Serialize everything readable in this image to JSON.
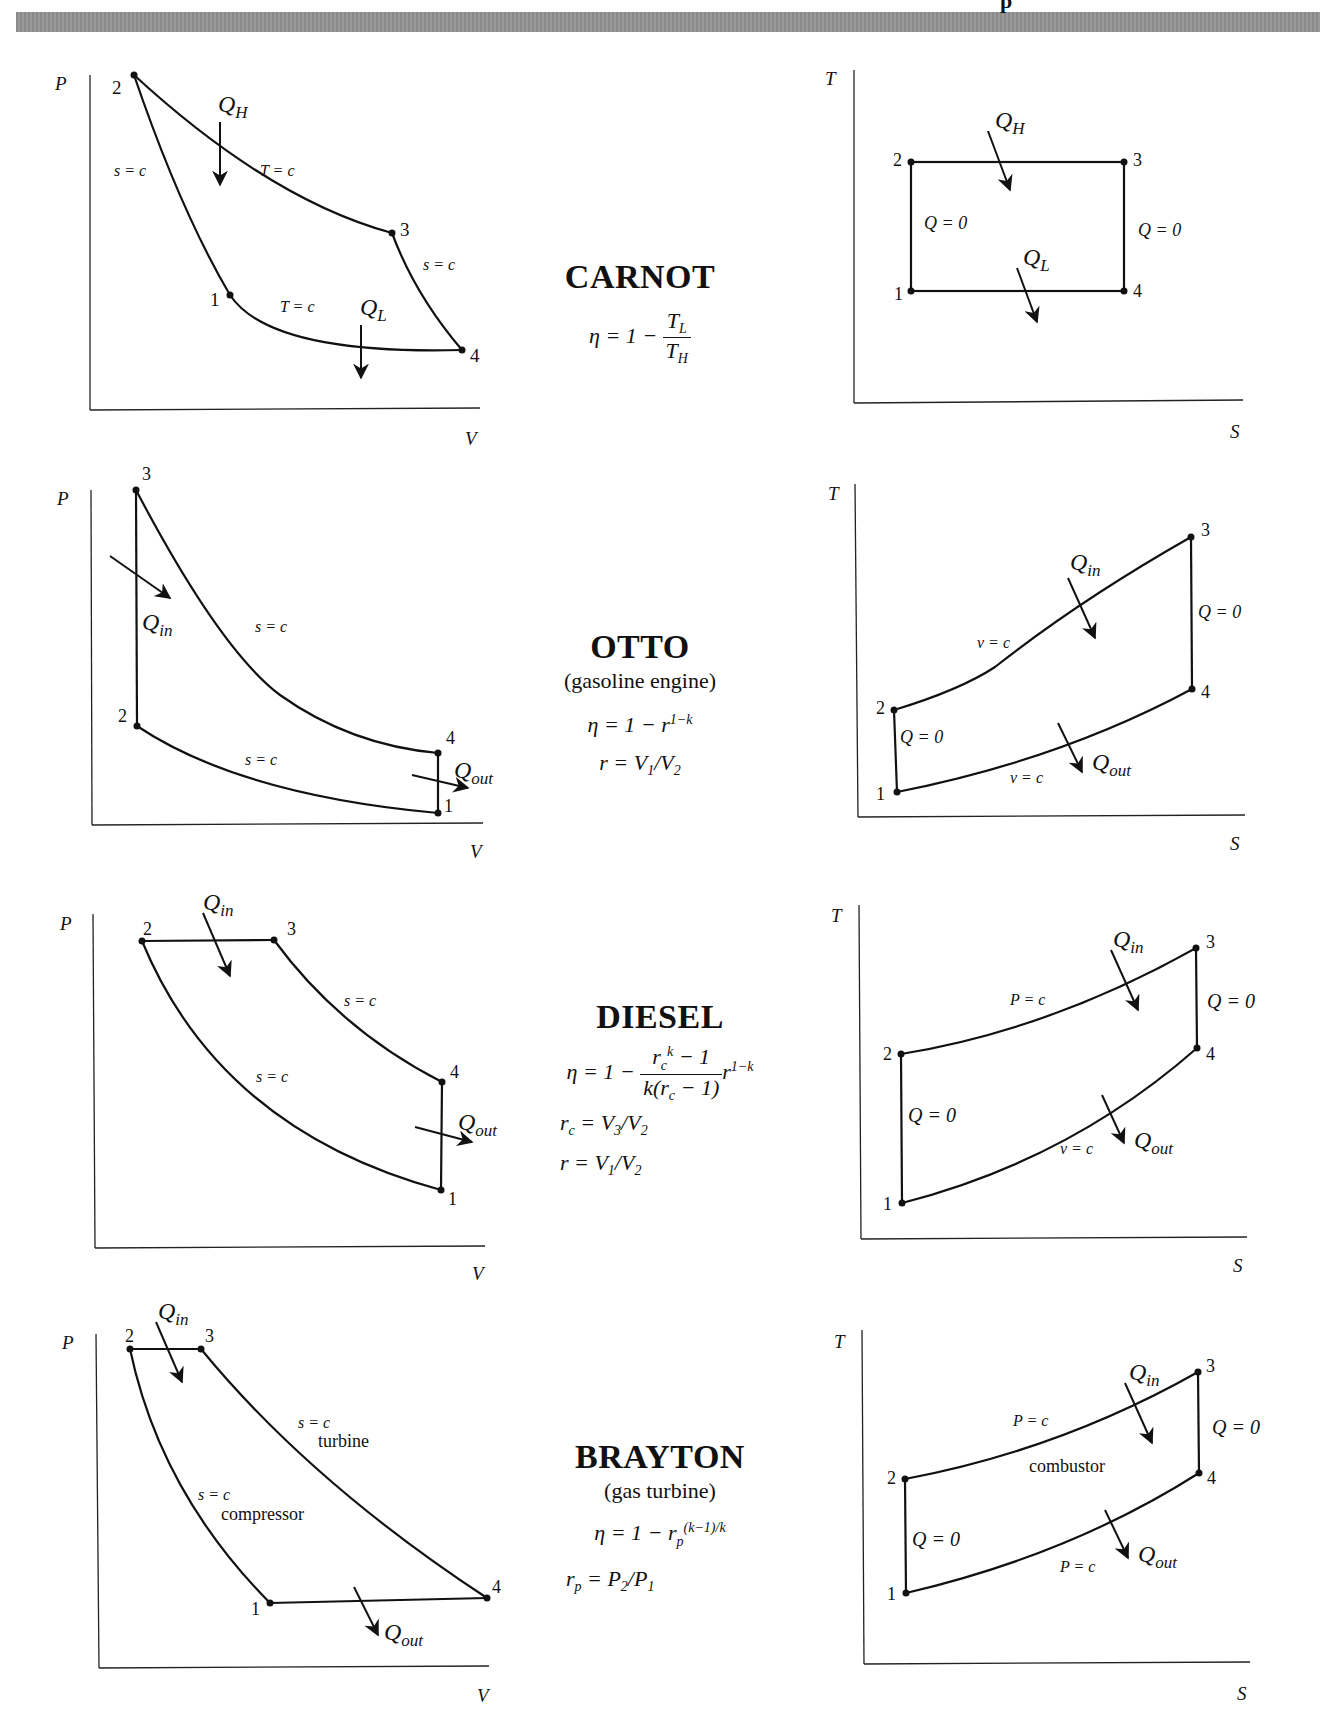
{
  "header": {
    "band_color": "#909090",
    "clipped_title_fragment": "p"
  },
  "cycles": [
    {
      "name": "CARNOT",
      "subtitle": "",
      "efficiency": "η = 1 − T_L / T_H",
      "eq_parts": {
        "lhs": "η = 1 −",
        "num": "T",
        "num_sub": "L",
        "den": "T",
        "den_sub": "H"
      },
      "extra_eqs": [],
      "pv": {
        "x_axis": "V",
        "y_axis": "P",
        "points": {
          "1": "1",
          "2": "2",
          "3": "3",
          "4": "4"
        },
        "labels": [
          "s = c",
          "T = c",
          "s = c",
          "T = c"
        ],
        "heat": [
          "Q_H",
          "Q_L"
        ],
        "heat_main": "Q",
        "heat_in_sub": "H",
        "heat_out_sub": "L"
      },
      "ts": {
        "x_axis": "S",
        "y_axis": "T",
        "labels": [
          "Q = 0",
          "Q = 0"
        ],
        "heat_main": "Q",
        "heat_in_sub": "H",
        "heat_out_sub": "L"
      }
    },
    {
      "name": "OTTO",
      "subtitle": "(gasoline engine)",
      "efficiency": "η = 1 − r^(1−k)",
      "eq_lhs": "η = 1 − r",
      "eq_sup": "1−k",
      "extra_eqs": [
        "r = V1/V2"
      ],
      "r_def": {
        "lhs": "r = V",
        "s1": "1",
        "mid": "/V",
        "s2": "2"
      },
      "pv": {
        "x_axis": "V",
        "y_axis": "P",
        "labels": [
          "s = c",
          "s = c"
        ],
        "heat_main": "Q",
        "heat_in_sub": "in",
        "heat_out_sub": "out"
      },
      "ts": {
        "x_axis": "S",
        "y_axis": "T",
        "labels": [
          "v = c",
          "v = c",
          "Q = 0",
          "Q = 0"
        ],
        "heat_main": "Q",
        "heat_in_sub": "in",
        "heat_out_sub": "out"
      }
    },
    {
      "name": "DIESEL",
      "subtitle": "",
      "efficiency": "η = 1 − (r_c^k − 1) / (k(r_c − 1)) · r^(1−k)",
      "eq": {
        "lhs": "η = 1 −",
        "num": "r",
        "num_sub": "c",
        "num_sup": "k",
        "num_tail": " − 1",
        "den": "k(r",
        "den_sub": "c",
        "den_tail": " − 1)",
        "tail": "r",
        "tail_sup": "1−k"
      },
      "extra_eqs": [
        "r_c = V3/V2",
        "r = V1/V2"
      ],
      "rc_def": {
        "lhs": "r",
        "lhs_sub": "c",
        "mid": " = V",
        "s1": "3",
        "mid2": "/V",
        "s2": "2"
      },
      "r_def": {
        "lhs": "r = V",
        "s1": "1",
        "mid": "/V",
        "s2": "2"
      },
      "pv": {
        "x_axis": "V",
        "y_axis": "P",
        "labels": [
          "s = c",
          "s = c"
        ],
        "heat_main": "Q",
        "heat_in_sub": "in",
        "heat_out_sub": "out"
      },
      "ts": {
        "x_axis": "S",
        "y_axis": "T",
        "labels": [
          "P = c",
          "v = c",
          "Q = 0",
          "Q = 0"
        ],
        "heat_main": "Q",
        "heat_in_sub": "in",
        "heat_out_sub": "out"
      }
    },
    {
      "name": "BRAYTON",
      "subtitle": "(gas turbine)",
      "efficiency": "η = 1 − r_p^((k−1)/k)",
      "eq": {
        "lhs": "η = 1 − r",
        "sub": "p",
        "sup": "(k−1)/k"
      },
      "extra_eqs": [
        "r_p = P2/P1"
      ],
      "rp_def": {
        "lhs": "r",
        "lhs_sub": "p",
        "mid": " = P",
        "s1": "2",
        "mid2": "/P",
        "s2": "1"
      },
      "pv": {
        "x_axis": "V",
        "y_axis": "P",
        "labels": [
          "s = c",
          "s = c"
        ],
        "components": [
          "turbine",
          "compressor"
        ],
        "heat_main": "Q",
        "heat_in_sub": "in",
        "heat_out_sub": "out"
      },
      "ts": {
        "x_axis": "S",
        "y_axis": "T",
        "labels": [
          "P = c",
          "P = c",
          "Q = 0",
          "Q = 0"
        ],
        "components": [
          "combustor"
        ],
        "heat_main": "Q",
        "heat_in_sub": "in",
        "heat_out_sub": "out"
      }
    }
  ],
  "state_points": [
    "1",
    "2",
    "3",
    "4"
  ]
}
